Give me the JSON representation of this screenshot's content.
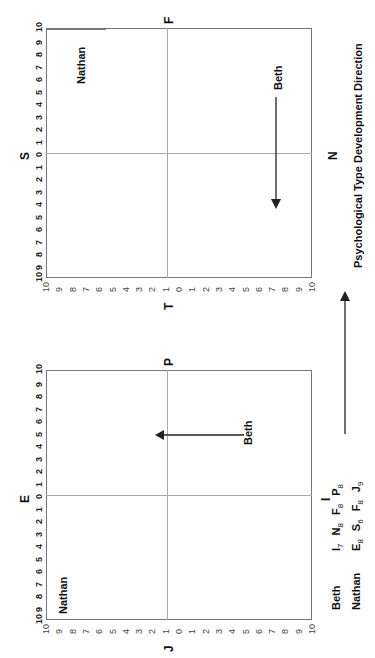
{
  "figure": {
    "title": "Psychological Type Development Direction",
    "orientation": "rotated 90 degrees counter-clockwise",
    "charts": [
      {
        "id": "upper",
        "axis_labels": {
          "left": "S",
          "right": "N",
          "top": "F",
          "bottom": "T"
        },
        "horizontal_ticks": [
          "10",
          "9",
          "8",
          "7",
          "6",
          "5",
          "4",
          "3",
          "2",
          "1",
          "0",
          "1",
          "2",
          "3",
          "4",
          "5",
          "6",
          "7",
          "8",
          "9",
          "10"
        ],
        "vertical_ticks": [
          "10",
          "9",
          "8",
          "7",
          "6",
          "5",
          "4",
          "3",
          "2",
          "1",
          "0",
          "1",
          "2",
          "3",
          "4",
          "5",
          "6",
          "7",
          "8",
          "9",
          "10"
        ],
        "labels": {
          "nathan": "Nathan",
          "beth": "Beth"
        }
      },
      {
        "id": "lower",
        "axis_labels": {
          "left": "E",
          "right": "I",
          "top": "P",
          "bottom": "J"
        },
        "horizontal_ticks": [
          "10",
          "9",
          "8",
          "7",
          "6",
          "5",
          "4",
          "3",
          "2",
          "1",
          "0",
          "1",
          "2",
          "3",
          "4",
          "5",
          "6",
          "7",
          "8",
          "9",
          "10"
        ],
        "vertical_ticks": [
          "10",
          "9",
          "8",
          "7",
          "6",
          "5",
          "4",
          "3",
          "2",
          "1",
          "0",
          "1",
          "2",
          "3",
          "4",
          "5",
          "6",
          "7",
          "8",
          "9",
          "10"
        ],
        "labels": {
          "nathan": "Nathan",
          "beth": "Beth"
        }
      }
    ],
    "legend": {
      "rows": [
        {
          "name": "Beth",
          "scores": [
            {
              "l": "I",
              "s": "7"
            },
            {
              "l": "N",
              "s": "8"
            },
            {
              "l": "F",
              "s": "8"
            },
            {
              "l": "P",
              "s": "8"
            }
          ]
        },
        {
          "name": "Nathan",
          "scores": [
            {
              "l": "E",
              "s": "8"
            },
            {
              "l": "S",
              "s": "6"
            },
            {
              "l": "F",
              "s": "8"
            },
            {
              "l": "J",
              "s": "9"
            }
          ]
        }
      ]
    }
  },
  "chart_data": [
    {
      "type": "scatter",
      "title": "S–N / T–F preference plane",
      "xlabel": "S ← 0 → N",
      "ylabel": "T ← 0 → F",
      "xlim": [
        -10,
        10
      ],
      "ylim": [
        -10,
        10
      ],
      "grid": false,
      "points": [
        {
          "name": "Nathan",
          "x": -6,
          "y": 8
        },
        {
          "name": "Beth",
          "x": 8,
          "y": 8
        }
      ],
      "annotations": [
        {
          "text": "Beth development arrow",
          "from": [
            8,
            8
          ],
          "to": [
            -4,
            8
          ]
        }
      ]
    },
    {
      "type": "scatter",
      "title": "E–I / J–P preference plane",
      "xlabel": "E ← 0 → I",
      "ylabel": "J ← 0 → P",
      "xlim": [
        -10,
        10
      ],
      "ylim": [
        -10,
        10
      ],
      "grid": false,
      "points": [
        {
          "name": "Nathan",
          "x": -8,
          "y": -9
        },
        {
          "name": "Beth",
          "x": 7,
          "y": 8
        }
      ],
      "annotations": [
        {
          "text": "Beth development arrow",
          "from": [
            7,
            8
          ],
          "to": [
            7,
            -1
          ]
        }
      ]
    }
  ]
}
